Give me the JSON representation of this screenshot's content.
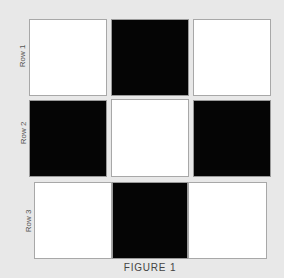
{
  "figure": {
    "caption": "FIGURE 1",
    "colors": {
      "background": "#e8e8e8",
      "white": "#ffffff",
      "black": "#050505"
    },
    "rows": [
      {
        "label": "Row 1",
        "cells": [
          "white",
          "black",
          "white"
        ]
      },
      {
        "label": "Row 2",
        "cells": [
          "black",
          "white",
          "black"
        ]
      },
      {
        "label": "Row 3",
        "cells": [
          "white",
          "black",
          "white"
        ]
      }
    ]
  }
}
